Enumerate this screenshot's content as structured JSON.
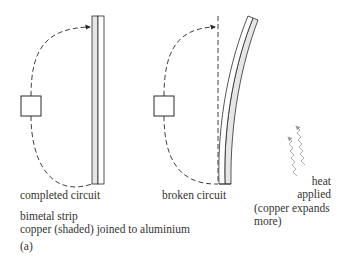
{
  "diagram": {
    "panels": [
      {
        "name": "completed",
        "caption": "completed circuit"
      },
      {
        "name": "broken",
        "caption": "broken circuit"
      }
    ],
    "heat": {
      "line1": "heat",
      "line2": "applied",
      "line3": "(copper expands",
      "line4": "more)"
    },
    "description": {
      "line1": "bimetal strip",
      "line2": "copper (shaded) joined to aluminium"
    },
    "figure_label": "(a)",
    "colors": {
      "stroke": "#2a2a2a",
      "copper_shade": "#e6e6e6",
      "heat_arrow": "#9a9a9a"
    }
  }
}
